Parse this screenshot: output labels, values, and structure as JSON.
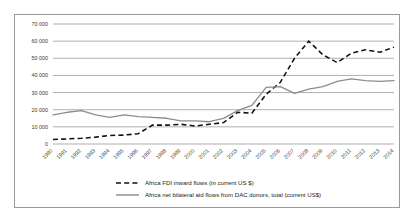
{
  "chart_data": {
    "type": "line",
    "title": "",
    "xlabel": "",
    "ylabel": "",
    "grid": true,
    "legend_position": "bottom",
    "ylim": [
      0,
      70000
    ],
    "yticks": [
      0,
      10000,
      20000,
      30000,
      40000,
      50000,
      60000,
      70000
    ],
    "ytick_labels": [
      "0",
      "10 000",
      "20 000",
      "30 000",
      "40 000",
      "50 000",
      "60 000",
      "70 000"
    ],
    "categories": [
      "1990",
      "1991",
      "1992",
      "1993",
      "1994",
      "1995",
      "1996",
      "1997",
      "1998",
      "1999",
      "2000",
      "2001",
      "2002",
      "2003",
      "2004",
      "2005",
      "2006",
      "2007",
      "2008",
      "2009",
      "2010",
      "2011",
      "2012",
      "2013",
      "2014"
    ],
    "series": [
      {
        "name": "Africa FDI inward flows (in current US $)",
        "style": "dashed",
        "color": "#111111",
        "values": [
          2600,
          3000,
          3300,
          4000,
          5000,
          5200,
          6000,
          11000,
          11000,
          11500,
          10500,
          11500,
          12500,
          18500,
          18000,
          29000,
          36000,
          50000,
          60000,
          52000,
          47500,
          53000,
          55000,
          53500,
          56500
        ]
      },
      {
        "name": "Africa net bilateral aid flows from DAC donors, total (current US$)",
        "style": "solid",
        "color": "#8c8c8c",
        "values": [
          17000,
          18500,
          19500,
          17000,
          15500,
          17000,
          16000,
          15500,
          15000,
          13500,
          13500,
          13000,
          15000,
          19500,
          22500,
          33000,
          33500,
          29500,
          32000,
          33500,
          36500,
          38000,
          37000,
          36500,
          37000
        ]
      }
    ],
    "legend": [
      {
        "label": "Africa FDI inward flows (in current US $)",
        "style": "dashed"
      },
      {
        "label": "Africa net bilateral aid flows from DAC donors, total (current US$)",
        "style": "solid"
      }
    ]
  }
}
